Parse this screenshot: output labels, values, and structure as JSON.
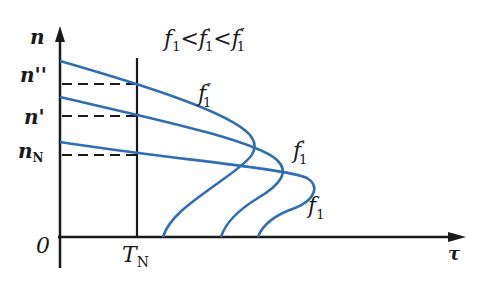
{
  "diagram": {
    "y_axis_label": "n",
    "x_axis_label": "τ",
    "origin_label": "0",
    "y_ticks": [
      "n''",
      "n'",
      "nN"
    ],
    "x_ticks": [
      "TN"
    ],
    "curves": [
      {
        "name": "f1''",
        "label": "f1''"
      },
      {
        "name": "f1'",
        "label": "f1'"
      },
      {
        "name": "f1",
        "label": "f1"
      }
    ],
    "colors": {
      "curve": "#2f6db5",
      "axis": "#1a1a1a"
    }
  }
}
